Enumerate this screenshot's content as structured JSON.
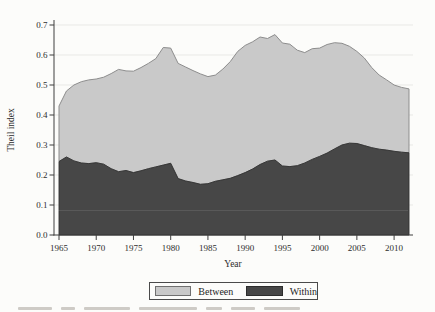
{
  "chart_data": {
    "type": "area",
    "stacked": true,
    "title": "",
    "xlabel": "Year",
    "ylabel": "Theil index",
    "grid": true,
    "legend_position": "bottom",
    "ylim": [
      0.0,
      0.7
    ],
    "yticks": [
      0.0,
      0.1,
      0.2,
      0.3,
      0.4,
      0.5,
      0.6,
      0.7
    ],
    "xticks": [
      1965,
      1970,
      1975,
      1980,
      1985,
      1990,
      1995,
      2000,
      2005,
      2010
    ],
    "x": [
      1965,
      1966,
      1967,
      1968,
      1969,
      1970,
      1971,
      1972,
      1973,
      1974,
      1975,
      1976,
      1977,
      1978,
      1979,
      1980,
      1981,
      1982,
      1983,
      1984,
      1985,
      1986,
      1987,
      1988,
      1989,
      1990,
      1991,
      1992,
      1993,
      1994,
      1995,
      1996,
      1997,
      1998,
      1999,
      2000,
      2001,
      2002,
      2003,
      2004,
      2005,
      2006,
      2007,
      2008,
      2009,
      2010,
      2011,
      2012
    ],
    "series": [
      {
        "name": "Within",
        "color": "#474747",
        "stroke": "#323232",
        "values": [
          0.245,
          0.26,
          0.247,
          0.24,
          0.238,
          0.241,
          0.236,
          0.221,
          0.211,
          0.215,
          0.208,
          0.214,
          0.221,
          0.227,
          0.233,
          0.239,
          0.188,
          0.18,
          0.175,
          0.169,
          0.171,
          0.179,
          0.184,
          0.189,
          0.198,
          0.208,
          0.22,
          0.235,
          0.246,
          0.25,
          0.23,
          0.228,
          0.231,
          0.24,
          0.252,
          0.262,
          0.273,
          0.287,
          0.3,
          0.306,
          0.305,
          0.298,
          0.291,
          0.286,
          0.283,
          0.279,
          0.276,
          0.274
        ]
      },
      {
        "name": "Between",
        "color": "#c9c9c9",
        "stroke": "#8d8d8d",
        "values": [
          0.185,
          0.22,
          0.253,
          0.271,
          0.279,
          0.279,
          0.29,
          0.317,
          0.341,
          0.332,
          0.338,
          0.344,
          0.351,
          0.361,
          0.392,
          0.384,
          0.384,
          0.38,
          0.373,
          0.368,
          0.357,
          0.354,
          0.369,
          0.389,
          0.414,
          0.424,
          0.424,
          0.425,
          0.409,
          0.418,
          0.41,
          0.408,
          0.385,
          0.368,
          0.369,
          0.361,
          0.362,
          0.354,
          0.339,
          0.323,
          0.307,
          0.292,
          0.267,
          0.247,
          0.234,
          0.221,
          0.216,
          0.213
        ]
      }
    ]
  },
  "axes": {
    "grid_color": "#e9e9e6",
    "spine_color": "#3f3f3f",
    "y_tick_format_decimals": 1
  }
}
